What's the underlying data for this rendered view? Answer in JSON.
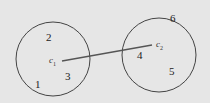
{
  "diagram": {
    "background": "#e6e6e6",
    "stroke_color": "#444444",
    "clusters": [
      {
        "id": "cluster-1",
        "centroid": {
          "label": "c",
          "subscript": "1"
        },
        "points": [
          {
            "label": "2"
          },
          {
            "label": "3"
          },
          {
            "label": "1"
          }
        ]
      },
      {
        "id": "cluster-2",
        "centroid": {
          "label": "c",
          "subscript": "2"
        },
        "points": [
          {
            "label": "6"
          },
          {
            "label": "4"
          },
          {
            "label": "5"
          }
        ]
      }
    ],
    "connector": {
      "from": "c1",
      "to": "c2"
    }
  }
}
